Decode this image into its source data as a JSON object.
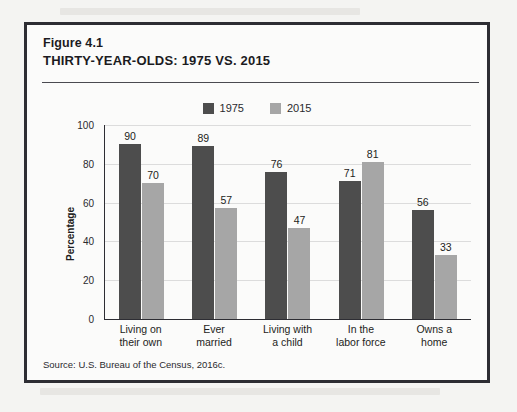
{
  "figure": {
    "label": "Figure 4.1",
    "title": "THIRTY-YEAR-OLDS: 1975 VS. 2015",
    "source_prefix": "Source:",
    "source_text": "U.S. Bureau of the Census, 2016c."
  },
  "colors": {
    "series_1975": "#4d4d4d",
    "series_2015": "#a6a6a6",
    "frame": "#2d2d33",
    "grid": "#dcdcdc",
    "page_background": "#f4f4f2",
    "figure_background": "#fbfbfa"
  },
  "chart_data": {
    "type": "bar",
    "title": "THIRTY-YEAR-OLDS: 1975 VS. 2015",
    "xlabel": "",
    "ylabel": "Percentage",
    "ylim": [
      0,
      100
    ],
    "yticks": [
      100,
      80,
      60,
      40,
      20,
      0
    ],
    "grid": true,
    "legend_position": "top-center",
    "categories": [
      "Living on their own",
      "Ever married",
      "Living with a child",
      "In the labor force",
      "Owns a home"
    ],
    "category_lines": [
      [
        "Living on",
        "their own"
      ],
      [
        "Ever",
        "married"
      ],
      [
        "Living with",
        "a child"
      ],
      [
        "In the",
        "labor force"
      ],
      [
        "Owns a",
        "home"
      ]
    ],
    "series": [
      {
        "name": "1975",
        "color": "#4d4d4d",
        "values": [
          90,
          89,
          76,
          71,
          56
        ]
      },
      {
        "name": "2015",
        "color": "#a6a6a6",
        "values": [
          70,
          57,
          47,
          81,
          33
        ]
      }
    ]
  }
}
